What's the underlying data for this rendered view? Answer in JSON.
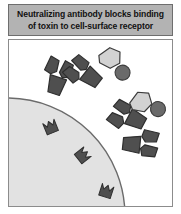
{
  "figure": {
    "caption_lines": [
      "Neutralizing antibody blocks binding",
      "of toxin to cell-surface receptor"
    ],
    "caption_full": "Neutralizing antibody blocks binding of toxin to cell-surface receptor",
    "panel_label": "illustration-panel"
  },
  "colors": {
    "caption_background": "#b3b3b3",
    "caption_border": "#6e6e6e",
    "caption_text": "#111111",
    "panel_background": "#ffffff",
    "panel_border": "#8c8c8c",
    "cell_fill": "#e2e2e2",
    "cell_outline": "#6b6b6b",
    "antibody_fill": "#4f4f4f",
    "antibody_outline": "#2e2e2e",
    "toxin_fill": "#d2d2d2",
    "toxin_outline": "#3c3c3c",
    "toxin_knob_fill": "#6a6a6a",
    "receptor_fill": "#4f4f4f",
    "receptor_outline": "#2e2e2e"
  },
  "scene": {
    "cell": {
      "name": "cell-body",
      "description": "Large pale cell occupying lower-left corner",
      "cx": -2,
      "cy": 176,
      "r": 118
    },
    "receptors": [
      {
        "name": "cell-surface-receptor-1",
        "x": 42,
        "y": 88,
        "rotation": -22
      },
      {
        "name": "cell-surface-receptor-2",
        "x": 73,
        "y": 116,
        "rotation": 52
      },
      {
        "name": "cell-surface-receptor-3",
        "x": 97,
        "y": 152,
        "rotation": 18
      }
    ],
    "antibodies": [
      {
        "name": "free-antibody",
        "x": 48,
        "y": 40,
        "rotation": 18,
        "bound": false
      },
      {
        "name": "antibody-bound-to-toxin-upper",
        "x": 78,
        "y": 35,
        "rotation": -52,
        "bound": true
      },
      {
        "name": "antibody-bound-to-toxin-lower",
        "x": 122,
        "y": 78,
        "rotation": -62,
        "bound": true
      },
      {
        "name": "antibody-lower-right",
        "x": 128,
        "y": 104,
        "rotation": 8,
        "bound": false
      }
    ],
    "toxins": [
      {
        "name": "toxin-upper",
        "x": 101,
        "y": 18,
        "rotation": 28
      },
      {
        "name": "toxin-lower",
        "x": 132,
        "y": 62,
        "rotation": 10
      }
    ]
  }
}
